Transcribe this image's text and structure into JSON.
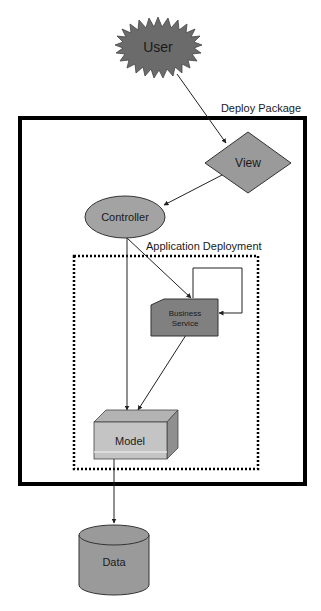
{
  "diagram": {
    "containers": {
      "deploy_package": {
        "label": "Deploy Package"
      },
      "application_deployment": {
        "label": "Application Deployment"
      }
    },
    "nodes": {
      "user": {
        "label": "User",
        "shape": "starburst",
        "fill": "#6b6b6b"
      },
      "view": {
        "label": "View",
        "shape": "diamond",
        "fill": "#9a9a9a"
      },
      "controller": {
        "label": "Controller",
        "shape": "ellipse",
        "fill": "#a3a3a3"
      },
      "business_service": {
        "label_line1": "Business",
        "label_line2": "Service",
        "shape": "card",
        "fill": "#808080"
      },
      "model": {
        "label": "Model",
        "shape": "3d-box",
        "fill": "#c4c4c4"
      },
      "data": {
        "label": "Data",
        "shape": "cylinder",
        "fill": "#9a9a9a"
      }
    },
    "edges": [
      {
        "from": "User",
        "to": "View"
      },
      {
        "from": "View",
        "to": "Controller"
      },
      {
        "from": "Controller",
        "to": "Business Service"
      },
      {
        "from": "Controller",
        "to": "Model"
      },
      {
        "from": "Business Service",
        "to": "Business Service"
      },
      {
        "from": "Business Service",
        "to": "Model"
      },
      {
        "from": "Model",
        "to": "Data"
      }
    ]
  }
}
